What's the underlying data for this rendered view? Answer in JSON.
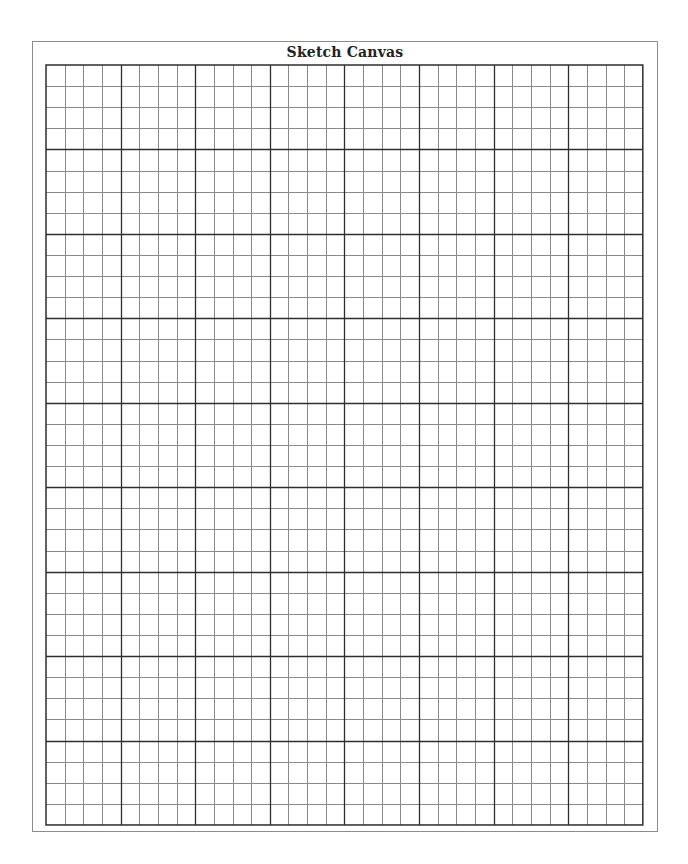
{
  "canvas": {
    "title": "Sketch Canvas",
    "grid": {
      "major_columns": 8,
      "major_rows": 9,
      "minor_per_major": 4,
      "cell_width": 18.65,
      "cell_height": 21.11,
      "minor_line_color": "#8a8a8a",
      "major_line_color": "#2e2e2e",
      "border_color": "#2e2e2e"
    },
    "frame_border_color": "#8c8c8c"
  }
}
